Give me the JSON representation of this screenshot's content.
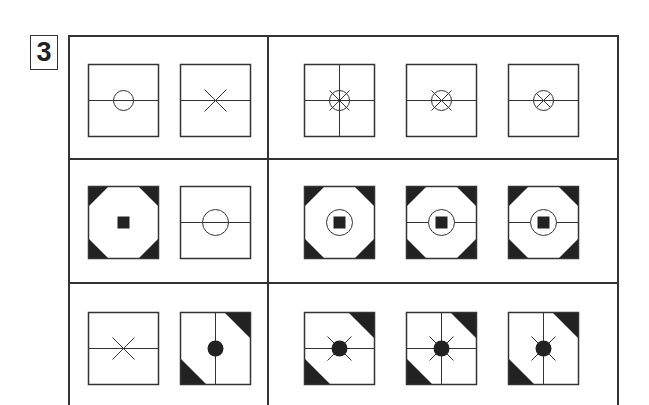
{
  "puzzle": {
    "number": "3",
    "rows": [
      {
        "given": [
          {
            "id": "r1-g1",
            "box": "plain",
            "lines": [
              "horizontal"
            ],
            "center": "circle"
          },
          {
            "id": "r1-g2",
            "box": "plain",
            "lines": [
              "horizontal"
            ],
            "center": "x"
          }
        ],
        "options": [
          {
            "id": "r1-o1",
            "box": "plain",
            "lines": [
              "horizontal",
              "vertical"
            ],
            "center": "circle-with-long-x"
          },
          {
            "id": "r1-o2",
            "box": "plain",
            "lines": [
              "horizontal"
            ],
            "center": "circle-with-long-x"
          },
          {
            "id": "r1-o3",
            "box": "plain",
            "lines": [
              "horizontal"
            ],
            "center": "circle-with-inner-x"
          }
        ]
      },
      {
        "given": [
          {
            "id": "r2-g1",
            "box": "octagon-corners",
            "lines": [],
            "center": "filled-square"
          },
          {
            "id": "r2-g2",
            "box": "plain",
            "lines": [
              "horizontal"
            ],
            "center": "large-circle"
          }
        ],
        "options": [
          {
            "id": "r2-o1",
            "box": "octagon-corners",
            "lines": [],
            "center": "circle-with-filled-square"
          },
          {
            "id": "r2-o2",
            "box": "octagon-corners",
            "lines": [
              "horizontal"
            ],
            "center": "circle-with-filled-square"
          },
          {
            "id": "r2-o3",
            "box": "octagon-corners",
            "lines": [
              "horizontal"
            ],
            "center": "circle-with-filled-square"
          }
        ]
      },
      {
        "given": [
          {
            "id": "r3-g1",
            "box": "plain",
            "lines": [
              "horizontal"
            ],
            "center": "x"
          },
          {
            "id": "r3-g2",
            "box": "diagonal-corners",
            "lines": [
              "vertical"
            ],
            "center": "filled-dot"
          }
        ],
        "options": [
          {
            "id": "r3-o1",
            "box": "diagonal-corners",
            "lines": [
              "horizontal"
            ],
            "center": "dot-with-x"
          },
          {
            "id": "r3-o2",
            "box": "diagonal-corners",
            "lines": [
              "horizontal",
              "vertical"
            ],
            "center": "dot-with-x"
          },
          {
            "id": "r3-o3",
            "box": "diagonal-corners",
            "lines": [
              "vertical"
            ],
            "center": "dot-with-x"
          }
        ]
      }
    ],
    "colors": {
      "ink": "#333333",
      "fill": "#222222",
      "background": "#ffffff"
    }
  }
}
